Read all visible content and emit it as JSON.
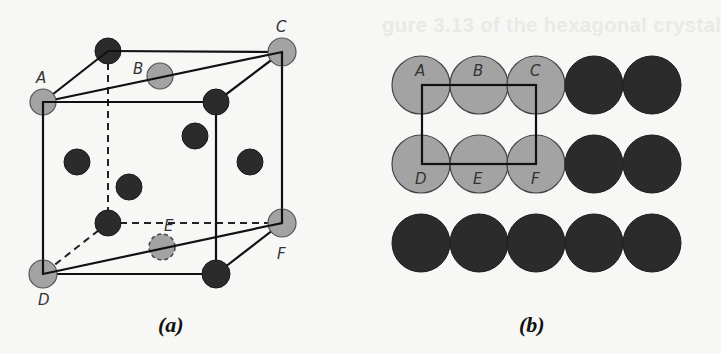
{
  "background_bleed": {
    "line1": "gure 3.13 of the hexagonal crystal",
    "line2": "ure in the"
  },
  "colors": {
    "gray_atom": "#a3a3a3",
    "dark_atom": "#2b2b2b",
    "line": "#111111",
    "background": "#f7f7f5"
  },
  "figure_a": {
    "caption": "(a)",
    "labels": {
      "A": "A",
      "B": "B",
      "C": "C",
      "D": "D",
      "E": "E",
      "F": "F"
    }
  },
  "figure_b": {
    "caption": "(b)",
    "labels": {
      "A": "A",
      "B": "B",
      "C": "C",
      "D": "D",
      "E": "E",
      "F": "F"
    },
    "rows": [
      [
        "gray",
        "gray",
        "gray",
        "dark",
        "dark"
      ],
      [
        "gray",
        "gray",
        "gray",
        "dark",
        "dark"
      ],
      [
        "dark",
        "dark",
        "dark",
        "dark",
        "dark"
      ]
    ]
  }
}
